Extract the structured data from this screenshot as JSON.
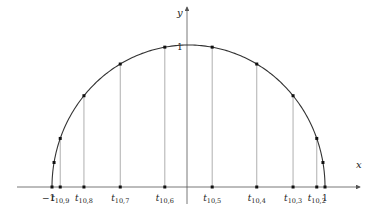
{
  "diagram": {
    "axes": {
      "x_label": "x",
      "y_label": "y",
      "y_tick_label": "1",
      "x_tick_neg": "−1",
      "x_tick_pos": "1"
    },
    "colors": {
      "curve": "#333333",
      "stems": "#9a9a9a",
      "axis": "#555555",
      "points": "#111111"
    },
    "nodes": [
      {
        "label_base": "t",
        "label_sub": "10,9",
        "x": -0.9397
      },
      {
        "label_base": "t",
        "label_sub": "10,8",
        "x": -0.766
      },
      {
        "label_base": "t",
        "label_sub": "10,7",
        "x": -0.5
      },
      {
        "label_base": "t",
        "label_sub": "10,6",
        "x": -0.1736
      },
      {
        "label_base": "t",
        "label_sub": "10,5",
        "x": 0.1736
      },
      {
        "label_base": "t",
        "label_sub": "10,4",
        "x": 0.5
      },
      {
        "label_base": "t",
        "label_sub": "10,3",
        "x": 0.766
      },
      {
        "label_base": "t",
        "label_sub": "10,2",
        "x": 0.9397
      }
    ],
    "endpoints": [
      -1,
      1
    ]
  }
}
